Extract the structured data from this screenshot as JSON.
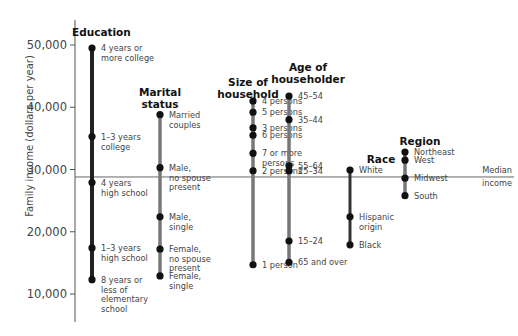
{
  "chart_data": {
    "type": "dot-range",
    "title": "",
    "xlabel": "",
    "ylabel": "Family income (dollars per year)",
    "ylim": [
      5000,
      52500
    ],
    "yticks": [
      10000,
      20000,
      30000,
      40000,
      50000
    ],
    "ytick_labels": [
      "10,000",
      "20,000",
      "30,000",
      "40,000",
      "50,000"
    ],
    "grid": false,
    "reference_line": {
      "value": 28800,
      "label": [
        "Median",
        "income"
      ]
    },
    "groups": [
      {
        "name": "Education",
        "title_lines": [
          "Education"
        ],
        "color": "#222222",
        "points": [
          {
            "label": [
              "4 years or",
              "more college"
            ],
            "value": 49500
          },
          {
            "label": [
              "1–3 years",
              "college"
            ],
            "value": 35300
          },
          {
            "label": [
              "4 years",
              "high school"
            ],
            "value": 27900
          },
          {
            "label": [
              "1–3 years",
              "high school"
            ],
            "value": 17400
          },
          {
            "label": [
              "8 years or",
              "less of",
              "elementary",
              "school"
            ],
            "value": 12300
          }
        ]
      },
      {
        "name": "Marital status",
        "title_lines": [
          "Marital",
          "status"
        ],
        "color": "#777777",
        "points": [
          {
            "label": [
              "Married",
              "couples"
            ],
            "value": 38800
          },
          {
            "label": [
              "Male,",
              "no spouse",
              "present"
            ],
            "value": 30300
          },
          {
            "label": [
              "Male,",
              "single"
            ],
            "value": 22400
          },
          {
            "label": [
              "Female,",
              "no spouse",
              "present"
            ],
            "value": 17200
          },
          {
            "label": [
              "Female,",
              "single"
            ],
            "value": 12900
          }
        ]
      },
      {
        "name": "Size of household",
        "title_lines": [
          "Size of",
          "household"
        ],
        "color": "#777777",
        "points": [
          {
            "label": [
              "4 persons"
            ],
            "value": 41000
          },
          {
            "label": [
              "5 persons"
            ],
            "value": 39200
          },
          {
            "label": [
              "3 persons"
            ],
            "value": 36700
          },
          {
            "label": [
              "6 persons"
            ],
            "value": 35500
          },
          {
            "label": [
              "7 or more",
              "persons"
            ],
            "value": 32600
          },
          {
            "label": [
              "2 persons"
            ],
            "value": 29800
          },
          {
            "label": [
              "1 person"
            ],
            "value": 14700
          }
        ]
      },
      {
        "name": "Age of householder",
        "title_lines": [
          "Age of",
          "householder"
        ],
        "color": "#777777",
        "points": [
          {
            "label": [
              "45–54"
            ],
            "value": 41800
          },
          {
            "label": [
              "35–44"
            ],
            "value": 38000
          },
          {
            "label": [
              "55–64"
            ],
            "value": 30600
          },
          {
            "label": [
              "25–34"
            ],
            "value": 29800
          },
          {
            "label": [
              "15–24"
            ],
            "value": 18500
          },
          {
            "label": [
              "65 and over"
            ],
            "value": 15100
          }
        ]
      },
      {
        "name": "Race",
        "title_lines": [
          "Race"
        ],
        "color": "#333333",
        "points": [
          {
            "label": [
              "White"
            ],
            "value": 29900
          },
          {
            "label": [
              "Hispanic",
              "origin"
            ],
            "value": 22400
          },
          {
            "label": [
              "Black"
            ],
            "value": 17900
          }
        ]
      },
      {
        "name": "Region",
        "title_lines": [
          "Region"
        ],
        "color": "#777777",
        "points": [
          {
            "label": [
              "Northeast"
            ],
            "value": 32800
          },
          {
            "label": [
              "West"
            ],
            "value": 31500
          },
          {
            "label": [
              "Midwest"
            ],
            "value": 28600
          },
          {
            "label": [
              "South"
            ],
            "value": 25800
          }
        ]
      }
    ]
  },
  "layout": {
    "width": 518,
    "height": 336,
    "axis_x": 75,
    "axis_top": 20,
    "axis_bottom": 322,
    "px_per_1000": 6.225,
    "y_at_50000": 45,
    "ref_line_x_end": 452,
    "group_x": [
      92,
      160,
      253,
      289,
      350,
      405
    ],
    "title_x": [
      72,
      160,
      248,
      308,
      381,
      420
    ],
    "title_y": [
      36,
      96,
      86,
      71,
      163,
      145
    ],
    "label_positions": [
      [
        [
          48
        ],
        [
          137
        ],
        [
          183
        ],
        [
          248
        ],
        [
          280
        ]
      ],
      [
        [
          115
        ],
        [
          168
        ],
        [
          217
        ],
        [
          249
        ],
        [
          276
        ]
      ],
      [
        [
          101
        ],
        [
          112
        ],
        [
          128
        ],
        [
          135
        ],
        [
          153
        ],
        [
          171
        ],
        [
          265
        ]
      ],
      [
        [
          96
        ],
        [
          120
        ],
        [
          166
        ],
        [
          171
        ],
        [
          241
        ],
        [
          262
        ]
      ],
      [
        [
          170
        ],
        [
          217
        ],
        [
          245
        ]
      ],
      [
        [
          152
        ],
        [
          160
        ],
        [
          178
        ],
        [
          196
        ]
      ]
    ]
  }
}
